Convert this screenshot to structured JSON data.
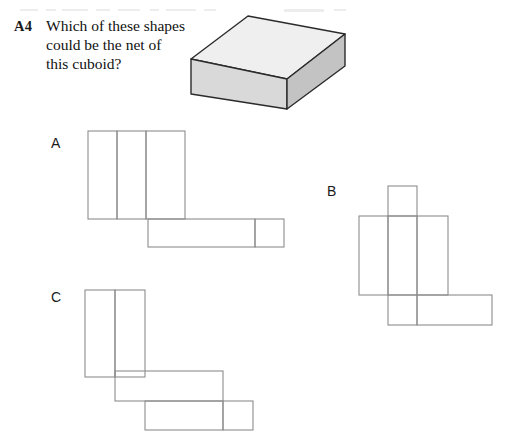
{
  "page": {
    "background_color": "#ffffff",
    "width": 506,
    "height": 441
  },
  "question": {
    "number": "A4",
    "text": "Which of these shapes could be the net of this cuboid?",
    "lines": [
      "Which of these shapes",
      "could be the net of",
      "this cuboid?"
    ]
  },
  "figure": {
    "name": "cuboid",
    "type": "3d-solid",
    "faces": {
      "top_color": "#efefef",
      "end_color": "#d9d9d9",
      "front_color": "#c3c3c3",
      "outline_color": "#2b2b2b"
    }
  },
  "options": [
    {
      "label": "A",
      "name": "net-a",
      "description": "Three tall rectangles in a row with a horizontal strip of two rectangles attached below the right end",
      "rectangles": [
        {
          "x": 8,
          "y": 7,
          "w": 29,
          "h": 88
        },
        {
          "x": 37,
          "y": 7,
          "w": 29,
          "h": 88
        },
        {
          "x": 66,
          "y": 7,
          "w": 39,
          "h": 88
        },
        {
          "x": 68,
          "y": 95,
          "w": 107,
          "h": 28
        },
        {
          "x": 175,
          "y": 95,
          "w": 29,
          "h": 28
        }
      ]
    },
    {
      "label": "B",
      "name": "net-b",
      "description": "Cross-like net: a small tab on top, a wide band of three rectangles, and a strip of two rectangles below",
      "rectangles": [
        {
          "x": 36,
          "y": 6,
          "w": 29,
          "h": 30
        },
        {
          "x": 7,
          "y": 36,
          "w": 29,
          "h": 79
        },
        {
          "x": 36,
          "y": 36,
          "w": 29,
          "h": 79
        },
        {
          "x": 65,
          "y": 36,
          "w": 31,
          "h": 79
        },
        {
          "x": 36,
          "y": 115,
          "w": 29,
          "h": 30
        },
        {
          "x": 65,
          "y": 115,
          "w": 75,
          "h": 30
        }
      ]
    },
    {
      "label": "C",
      "name": "net-c",
      "description": "Staircase net: a tall pair of rectangles, then a long strip stepped down and right, then another strip stepped down and right",
      "rectangles": [
        {
          "x": 7,
          "y": 6,
          "w": 30,
          "h": 87
        },
        {
          "x": 37,
          "y": 6,
          "w": 30,
          "h": 87
        },
        {
          "x": 37,
          "y": 87,
          "w": 108,
          "h": 30
        },
        {
          "x": 67,
          "y": 117,
          "w": 78,
          "h": 29
        },
        {
          "x": 145,
          "y": 117,
          "w": 30,
          "h": 29
        }
      ]
    }
  ],
  "style": {
    "net_edge_color": "#8d8d8d",
    "net_fold_color": "#a2a2a2",
    "text_color": "#111111"
  }
}
